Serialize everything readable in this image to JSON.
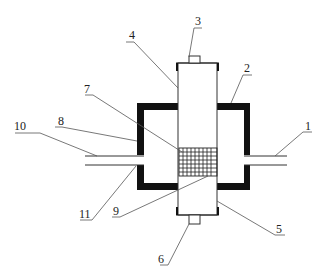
{
  "diagram": {
    "type": "patent-style cross-section drawing",
    "colors": {
      "line": "#333333",
      "wall": "#111111",
      "background": "#ffffff"
    },
    "components": [
      {
        "id": "1",
        "label": "1",
        "desc": "right pipe"
      },
      {
        "id": "2",
        "label": "2",
        "desc": "outer chamber wall"
      },
      {
        "id": "3",
        "label": "3",
        "desc": "top end nub"
      },
      {
        "id": "4",
        "label": "4",
        "desc": "vertical column / tube"
      },
      {
        "id": "5",
        "label": "5",
        "desc": "lower column section"
      },
      {
        "id": "6",
        "label": "6",
        "desc": "bottom end nub"
      },
      {
        "id": "7",
        "label": "7",
        "desc": "mesh / screen"
      },
      {
        "id": "8",
        "label": "8",
        "desc": "left chamber wall"
      },
      {
        "id": "9",
        "label": "9",
        "desc": "mesh lower boundary"
      },
      {
        "id": "10",
        "label": "10",
        "desc": "left upper pipe"
      },
      {
        "id": "11",
        "label": "11",
        "desc": "left lower pipe"
      }
    ],
    "labels": {
      "l1": "1",
      "l2": "2",
      "l3": "3",
      "l4": "4",
      "l5": "5",
      "l6": "6",
      "l7": "7",
      "l8": "8",
      "l9": "9",
      "l10": "10",
      "l11": "11"
    }
  }
}
